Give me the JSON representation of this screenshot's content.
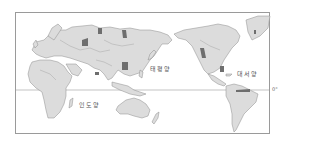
{
  "map": {
    "projection": "pacific-centered world map",
    "colors": {
      "land": "#dcdcdc",
      "highlight": "#6e6e6e",
      "border": "#9a9a9a",
      "ocean": "#ffffff"
    },
    "oceans": [
      {
        "id": "pacific",
        "label": "태평양"
      },
      {
        "id": "atlantic",
        "label": "대서양"
      },
      {
        "id": "indian",
        "label": "인도양"
      }
    ],
    "equator": {
      "label": "0°"
    }
  }
}
